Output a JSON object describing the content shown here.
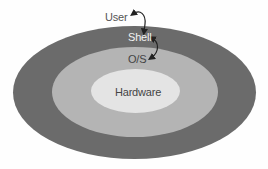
{
  "diagram": {
    "type": "nested-ellipses",
    "layers": [
      {
        "name": "Shell",
        "color": "#6b6b6b"
      },
      {
        "name": "O/S",
        "color": "#b4b4b4"
      },
      {
        "name": "Hardware",
        "color": "#e4e4e4"
      }
    ],
    "labels": {
      "user": "User",
      "shell": "Shell",
      "os": "O/S",
      "hardware": "Hardware"
    },
    "arrows": [
      {
        "from": "Shell",
        "to": "User",
        "style": "curved-bidirectional"
      },
      {
        "from": "Shell",
        "to": "O/S",
        "style": "curved-bidirectional"
      }
    ]
  }
}
